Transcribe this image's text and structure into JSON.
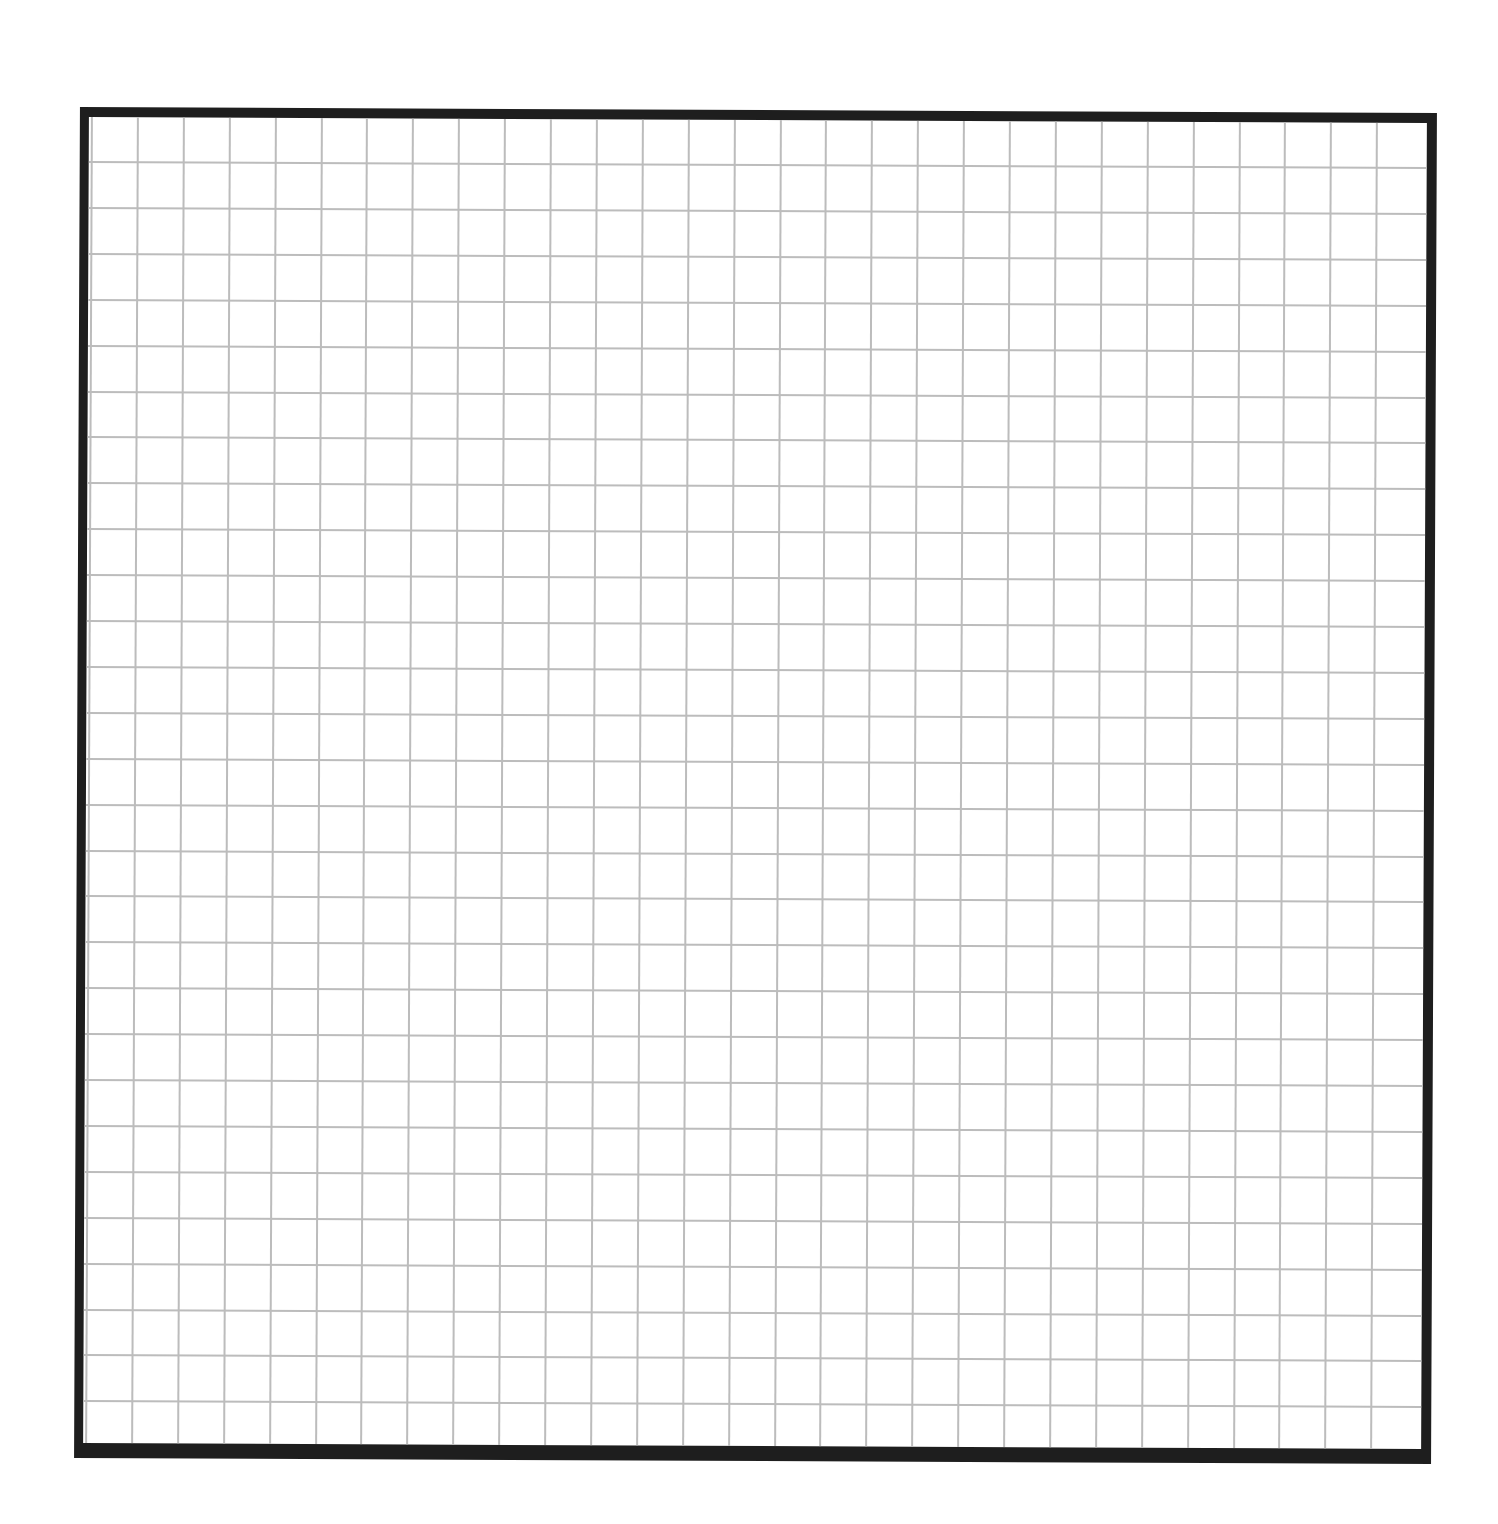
{
  "document": {
    "type": "graph-paper",
    "background_color": "#ffffff",
    "frame": {
      "color": "#1e1e1e",
      "left": 77,
      "top": 110,
      "width": 1338,
      "height": 1326,
      "border_top": 10,
      "border_left": 9,
      "border_right": 10,
      "border_bottom": 15
    },
    "grid": {
      "line_color": "#bcbcbc",
      "line_width": 2,
      "cell_size": 45.9,
      "first_vertical_offset": 2,
      "first_horizontal_offset": 44,
      "vertical_line_count": 29,
      "horizontal_line_count": 28
    }
  }
}
